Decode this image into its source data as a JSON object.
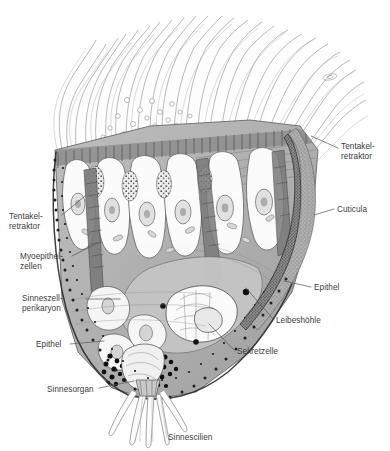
{
  "figure": {
    "background_color": "#ffffff",
    "ink_color": "#3b3b3b",
    "leader_color": "#555555",
    "palette": {
      "cuticula_fill": "#a0a0a0",
      "epithel_fill": "#8f8f8f",
      "leibeshoehle_fill": "#b4b4b4",
      "muscle_fill": "#9a9a9a",
      "cell_fill": "#f2f2f2",
      "granule_fill": "#1a1a1a",
      "cilia_stroke": "#9b9b9b"
    }
  },
  "labels": [
    {
      "id": "tentakelretraktor-right",
      "name": "tentakel-retraktor-right",
      "lines": [
        "Tentakel-",
        "retraktor"
      ],
      "x": 341,
      "y": 142,
      "align": "l",
      "leader": [
        [
          338,
          148
        ],
        [
          311,
          136
        ]
      ]
    },
    {
      "id": "cuticula",
      "name": "cuticula",
      "lines": [
        "Cuticula"
      ],
      "x": 337,
      "y": 205,
      "align": "l",
      "leader": [
        [
          334,
          209
        ],
        [
          314,
          215
        ]
      ]
    },
    {
      "id": "tentakelretraktor-left",
      "name": "tentakel-retraktor-left",
      "lines": [
        "Tentakel-",
        "retraktor"
      ],
      "x": 9,
      "y": 212,
      "align": "l",
      "leader": [
        [
          62,
          215
        ],
        [
          85,
          196
        ]
      ]
    },
    {
      "id": "myoepithelzellen",
      "name": "myoepithel-zellen",
      "lines": [
        "Myoepithel-",
        "zellen"
      ],
      "x": 20,
      "y": 252,
      "align": "l",
      "leader": [
        [
          72,
          256
        ],
        [
          98,
          243
        ]
      ]
    },
    {
      "id": "sinneszellperikaryon",
      "name": "sinneszell-perikaryon",
      "lines": [
        "Sinneszell-",
        "perikaryon"
      ],
      "x": 22,
      "y": 294,
      "align": "l",
      "leader": [
        [
          86,
          299
        ],
        [
          120,
          299
        ]
      ]
    },
    {
      "id": "epithel-left",
      "name": "epithel-left",
      "lines": [
        "Epithel"
      ],
      "x": 36,
      "y": 340,
      "align": "l",
      "leader": [
        [
          70,
          344
        ],
        [
          104,
          341
        ]
      ]
    },
    {
      "id": "sinnesorgan",
      "name": "sinnesorgan",
      "lines": [
        "Sinnesorgan"
      ],
      "x": 47,
      "y": 385,
      "align": "l",
      "leader": [
        [
          99,
          388
        ],
        [
          134,
          381
        ]
      ]
    },
    {
      "id": "epithel-right",
      "name": "epithel-right",
      "lines": [
        "Epithel"
      ],
      "x": 314,
      "y": 283,
      "align": "l",
      "leader": [
        [
          311,
          287
        ],
        [
          284,
          281
        ]
      ]
    },
    {
      "id": "leibeshoehle",
      "name": "leibeshoehle",
      "lines": [
        "Leibeshöhle"
      ],
      "x": 276,
      "y": 316,
      "align": "l",
      "leader": [
        [
          273,
          319
        ],
        [
          246,
          288
        ]
      ]
    },
    {
      "id": "sekretzelle",
      "name": "sekretzelle",
      "lines": [
        "Sekretzelle"
      ],
      "x": 237,
      "y": 347,
      "align": "l",
      "leader": [
        [
          234,
          350
        ],
        [
          209,
          324
        ]
      ]
    },
    {
      "id": "sinnescilien",
      "name": "sinnescilien",
      "lines": [
        "Sinnescilien"
      ],
      "x": 168,
      "y": 433,
      "align": "l",
      "leader": []
    }
  ]
}
